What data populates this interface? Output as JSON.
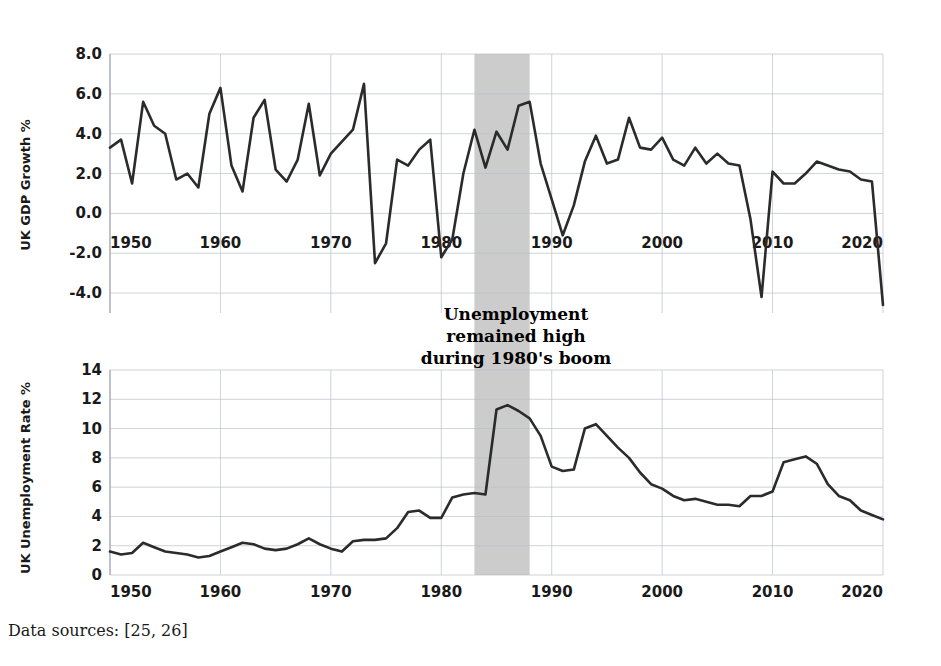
{
  "figure": {
    "background_color": "#ffffff",
    "line_color": "#2b2b2b",
    "grid_color": "#b9bfcc",
    "band_color": "#c9c9c9",
    "caption": "Data sources: [25, 26]"
  },
  "annotation": {
    "line1": "Unemployment",
    "line2": "remained high",
    "line3": "during 1980's boom",
    "band_start_year": 1983,
    "band_end_year": 1988
  },
  "chart_data": [
    {
      "id": "gdp",
      "type": "line",
      "title": "",
      "xlabel": "",
      "ylabel": "UK GDP Growth %",
      "xlim": [
        1950,
        2020
      ],
      "ylim": [
        -5.0,
        8.0
      ],
      "yticks": [
        "8.0",
        "6.0",
        "4.0",
        "2.0",
        "0.0",
        "-2.0",
        "-4.0"
      ],
      "ytick_values": [
        8.0,
        6.0,
        4.0,
        2.0,
        0.0,
        -2.0,
        -4.0
      ],
      "xticks": [
        "1950",
        "1960",
        "1970",
        "1980",
        "1990",
        "2000",
        "2010",
        "2020"
      ],
      "xtick_values": [
        1950,
        1960,
        1970,
        1980,
        1990,
        2000,
        2010,
        2020
      ],
      "grid": true,
      "legend": "none",
      "x": [
        1950,
        1951,
        1952,
        1953,
        1954,
        1955,
        1956,
        1957,
        1958,
        1959,
        1960,
        1961,
        1962,
        1963,
        1964,
        1965,
        1966,
        1967,
        1968,
        1969,
        1970,
        1971,
        1972,
        1973,
        1974,
        1975,
        1976,
        1977,
        1978,
        1979,
        1980,
        1981,
        1982,
        1983,
        1984,
        1985,
        1986,
        1987,
        1988,
        1989,
        1990,
        1991,
        1992,
        1993,
        1994,
        1995,
        1996,
        1997,
        1998,
        1999,
        2000,
        2001,
        2002,
        2003,
        2004,
        2005,
        2006,
        2007,
        2008,
        2009,
        2010,
        2011,
        2012,
        2013,
        2014,
        2015,
        2016,
        2017,
        2018,
        2019,
        2020
      ],
      "values": [
        3.3,
        3.7,
        1.5,
        5.6,
        4.4,
        4.0,
        1.7,
        2.0,
        1.3,
        5.0,
        6.3,
        2.4,
        1.1,
        4.8,
        5.7,
        2.2,
        1.6,
        2.7,
        5.5,
        1.9,
        3.0,
        3.6,
        4.2,
        6.5,
        -2.5,
        -1.5,
        2.7,
        2.4,
        3.2,
        3.7,
        -2.2,
        -1.3,
        2.0,
        4.2,
        2.3,
        4.1,
        3.2,
        5.4,
        5.6,
        2.5,
        0.7,
        -1.1,
        0.4,
        2.6,
        3.9,
        2.5,
        2.7,
        4.8,
        3.3,
        3.2,
        3.8,
        2.7,
        2.4,
        3.3,
        2.5,
        3.0,
        2.5,
        2.4,
        -0.3,
        -4.2,
        2.1,
        1.5,
        1.5,
        2.0,
        2.6,
        2.4,
        2.2,
        2.1,
        1.7,
        1.6,
        -4.6
      ]
    },
    {
      "id": "unemployment",
      "type": "line",
      "title": "",
      "xlabel": "",
      "ylabel": "UK Unemployment Rate %",
      "xlim": [
        1950,
        2020
      ],
      "ylim": [
        0,
        14
      ],
      "yticks": [
        "14",
        "12",
        "10",
        "8",
        "6",
        "4",
        "2",
        "0"
      ],
      "ytick_values": [
        14,
        12,
        10,
        8,
        6,
        4,
        2,
        0
      ],
      "xticks": [
        "1950",
        "1960",
        "1970",
        "1980",
        "1990",
        "2000",
        "2010",
        "2020"
      ],
      "xtick_values": [
        1950,
        1960,
        1970,
        1980,
        1990,
        2000,
        2010,
        2020
      ],
      "grid": true,
      "legend": "none",
      "x": [
        1950,
        1951,
        1952,
        1953,
        1954,
        1955,
        1956,
        1957,
        1958,
        1959,
        1960,
        1961,
        1962,
        1963,
        1964,
        1965,
        1966,
        1967,
        1968,
        1969,
        1970,
        1971,
        1972,
        1973,
        1974,
        1975,
        1976,
        1977,
        1978,
        1979,
        1980,
        1981,
        1982,
        1983,
        1984,
        1985,
        1986,
        1987,
        1988,
        1989,
        1990,
        1991,
        1992,
        1993,
        1994,
        1995,
        1996,
        1997,
        1998,
        1999,
        2000,
        2001,
        2002,
        2003,
        2004,
        2005,
        2006,
        2007,
        2008,
        2009,
        2010,
        2011,
        2012,
        2013,
        2014,
        2015,
        2016,
        2017,
        2018,
        2019,
        2020
      ],
      "values": [
        1.6,
        1.4,
        1.5,
        2.2,
        1.9,
        1.6,
        1.5,
        1.4,
        1.2,
        1.3,
        1.6,
        1.9,
        2.2,
        2.1,
        1.8,
        1.7,
        1.8,
        2.1,
        2.5,
        2.1,
        1.8,
        1.6,
        2.3,
        2.4,
        2.4,
        2.5,
        3.2,
        4.3,
        4.4,
        3.9,
        3.9,
        5.3,
        5.5,
        5.6,
        5.5,
        11.3,
        11.6,
        11.2,
        10.7,
        9.5,
        7.4,
        7.1,
        7.2,
        10.0,
        10.3,
        9.5,
        8.7,
        8.0,
        7.0,
        6.2,
        5.9,
        5.4,
        5.1,
        5.2,
        5.0,
        4.8,
        4.8,
        4.7,
        5.4,
        5.4,
        5.7,
        7.7,
        7.9,
        8.1,
        7.6,
        6.2,
        5.4,
        5.1,
        4.4,
        4.1,
        3.8
      ]
    }
  ]
}
